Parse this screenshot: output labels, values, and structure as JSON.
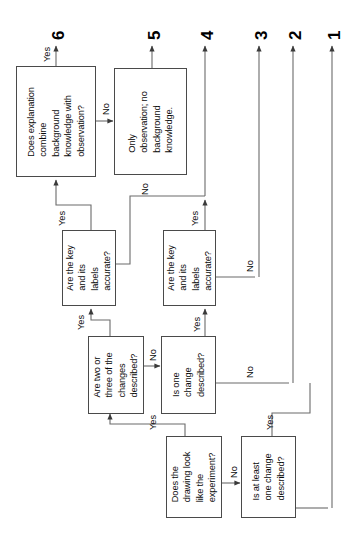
{
  "diagram": {
    "orientation": "rotated-90-ccw",
    "stroke_color": "#4a4a4a",
    "text_color": "#0a0a0a",
    "background": "#ffffff"
  },
  "nodes": [
    {
      "id": "explanation",
      "text": "Does explanation\ncombine\nbackground\nknowledge with\nobservation?"
    },
    {
      "id": "only-observation",
      "text": "Only\nobservation; no\nbackground\nknowledge."
    },
    {
      "id": "key-upper",
      "text": "Are the key\nand its\nlabels\naccurate?"
    },
    {
      "id": "key-lower",
      "text": "Are the key\nand its\nlabels\naccurate?"
    },
    {
      "id": "two-or-three",
      "text": "Are two or\nthree of the\nchanges\ndescribed?"
    },
    {
      "id": "one-change",
      "text": "Is one\nchange\ndescribed?"
    },
    {
      "id": "drawing-look",
      "text": "Does the\ndrawing look\nlike the\nexperiment?"
    },
    {
      "id": "at-least-one",
      "text": "Is at least\none change\ndescribed?"
    }
  ],
  "edge_labels": {
    "explanation_yes": "Yes",
    "explanation_no": "No",
    "key_upper_yes": "Yes",
    "key_upper_no": "No",
    "key_lower_yes": "Yes",
    "key_lower_no": "No",
    "two_or_three_yes": "Yes",
    "two_or_three_no": "No",
    "one_change_yes": "Yes",
    "one_change_no": "No",
    "drawing_look_yes": "Yes",
    "drawing_look_no": "No",
    "at_least_one_yes": "Yes",
    "at_least_one_no": "No"
  },
  "terminals": [
    {
      "id": "terminal-6",
      "label": "6"
    },
    {
      "id": "terminal-5",
      "label": "5"
    },
    {
      "id": "terminal-4",
      "label": "4"
    },
    {
      "id": "terminal-3",
      "label": "3"
    },
    {
      "id": "terminal-2",
      "label": "2"
    },
    {
      "id": "terminal-1",
      "label": "1"
    }
  ]
}
